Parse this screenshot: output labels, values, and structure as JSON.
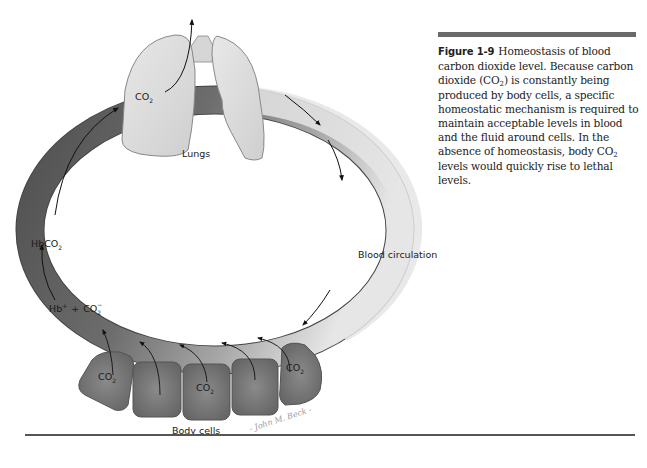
{
  "figure": {
    "number": "Figure 1-9",
    "caption_parts": {
      "p1": "Homeostasis of blood carbon dioxide level. Because carbon dioxide (CO",
      "p2": ") is constantly being produced by body cells, a specific homeostatic mechanism is required to maintain acceptable levels in blood and the fluid around cells. In the absence of homeostasis, body CO",
      "p3": " levels would quickly rise to lethal levels."
    },
    "subscript": "2"
  },
  "labels": {
    "lungs": "Lungs",
    "lungs_co2": "CO",
    "blood_circulation": "Blood circulation",
    "hbco2": "HbCO",
    "hb_plus": "Hb",
    "hb_sup": "+",
    "plus_sign": "+",
    "co2_ion": "CO",
    "ion_charge": "−",
    "body_cells": "Body cells",
    "cell_co2": "CO",
    "sub2": "2",
    "signature": "- John M. Beck -"
  },
  "colors": {
    "artery_light": "#e4e4e4",
    "vein_dark": "#5e5e5e",
    "lung_fill": "#dcdcdc",
    "cell_fill": "#7a7a7a",
    "rule": "#6a6a6a"
  }
}
